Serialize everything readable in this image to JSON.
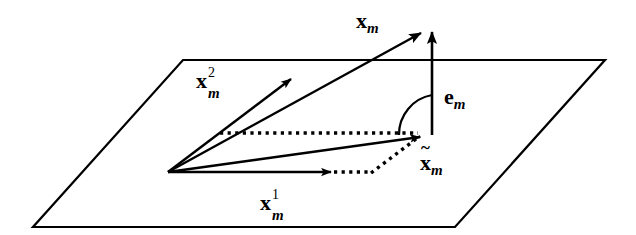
{
  "figure": {
    "kind": "vector-projection-diagram",
    "background_color": "#ffffff",
    "stroke_color": "#000000",
    "canvas": {
      "width": 636,
      "height": 235
    },
    "plane": {
      "name": "subspace-plane",
      "corners": [
        [
          183,
          60
        ],
        [
          605,
          60
        ],
        [
          455,
          227
        ],
        [
          33,
          227
        ]
      ],
      "stroke_width": 2.2
    },
    "origin": [
      168,
      172
    ],
    "labels": {
      "x_m": {
        "base": "x",
        "sub": "m",
        "sup": "",
        "tilde": false,
        "x": 356,
        "y": 10
      },
      "x_m_2": {
        "base": "x",
        "sub": "m",
        "sup": "2",
        "tilde": false,
        "x": 196,
        "y": 70
      },
      "x_m_1": {
        "base": "x",
        "sub": "m",
        "sup": "1",
        "tilde": false,
        "x": 260,
        "y": 192
      },
      "e_m": {
        "base": "e",
        "sub": "m",
        "sup": "",
        "tilde": false,
        "x": 444,
        "y": 86
      },
      "x_tilde_m": {
        "base": "x",
        "sub": "m",
        "sup": "",
        "tilde": true,
        "x": 420,
        "y": 152
      }
    },
    "vectors": [
      {
        "name": "x-m-vector",
        "style": "solid",
        "from": [
          168,
          172
        ],
        "to": [
          425,
          30
        ]
      },
      {
        "name": "x-m-2-basis-vector",
        "style": "solid",
        "from": [
          168,
          172
        ],
        "to": [
          295,
          76
        ]
      },
      {
        "name": "x-m-1-basis-vector",
        "style": "solid",
        "from": [
          168,
          172
        ],
        "to": [
          335,
          172
        ]
      },
      {
        "name": "x-tilde-m-projection-vector",
        "style": "solid",
        "from": [
          168,
          172
        ],
        "to": [
          424,
          134
        ]
      },
      {
        "name": "e-m-residual-vector",
        "style": "solid",
        "from": [
          432,
          135
        ],
        "to": [
          432,
          28
        ]
      }
    ],
    "construction_lines": [
      {
        "name": "parallelogram-upper-dotted-line",
        "style": "dotted",
        "from": [
          220,
          133
        ],
        "to": [
          418,
          133
        ]
      },
      {
        "name": "parallelogram-left-dotted-line",
        "style": "dotted",
        "from": [
          220,
          133
        ],
        "to": [
          168,
          172
        ]
      },
      {
        "name": "parallelogram-lower-dotted-line",
        "style": "dotted",
        "from": [
          335,
          172
        ],
        "to": [
          372,
          172
        ]
      },
      {
        "name": "parallelogram-diagonal-dotted-line",
        "style": "dotted",
        "from": [
          372,
          172
        ],
        "to": [
          419,
          137
        ]
      }
    ],
    "right_angle_arc": {
      "name": "right-angle-arc",
      "from": [
        400,
        134
      ],
      "to": [
        432,
        95
      ],
      "radius": 40
    }
  }
}
